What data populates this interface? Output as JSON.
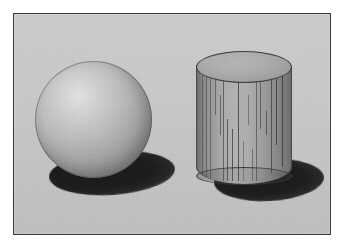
{
  "scene": {
    "title": "Rendered 3D Scene",
    "description": "Computer-generated image of a matte gray sphere and a gray cylinder resting on a light gray ground plane, each casting a dark elliptical shadow to the lower right.",
    "canvas": {
      "width": 344,
      "height": 247
    },
    "frame": {
      "matte_color": "#ffffff",
      "border_color": "#3a3a3a",
      "border_width_px": 1,
      "left": 13,
      "top": 13,
      "width": 318,
      "height": 222
    },
    "background": {
      "name": "ground-plane",
      "color_top": "#cfcfcf",
      "color_bottom": "#c2c2c2",
      "has_grain_noise": true
    },
    "light": {
      "name": "key-light",
      "direction": "upper-left",
      "shadow_direction": "lower-right",
      "shadow_color": "#1b1b1b"
    },
    "objects": [
      {
        "name": "sphere",
        "shape": "sphere",
        "surface": "matte",
        "base_color": "#ababab",
        "highlight_color": "#e6e6e6",
        "terminator_color": "#7e7e7e",
        "center_x": 92,
        "center_y": 119,
        "diameter_px": 117,
        "highlight_x_pct": 37,
        "highlight_y_pct": 30,
        "shadow": {
          "name": "sphere-shadow",
          "shape": "ellipse",
          "color": "#1b1b1b",
          "center_x": 98,
          "center_y": 172,
          "width_px": 126,
          "height_px": 44,
          "rotation_deg": -4
        }
      },
      {
        "name": "cylinder",
        "shape": "cylinder",
        "surface": "matte",
        "base_color": "#b5b5b5",
        "top_face_color": "#b1b1b1",
        "edge_color": "#3d3d3d",
        "left": 195,
        "top": 50,
        "width_px": 96,
        "height_px": 135,
        "top_ellipse_height_px": 32,
        "has_vertical_streak_artifacts": true,
        "streak_count": 18,
        "streak_color": "#303030",
        "shadow": {
          "name": "cylinder-shadow",
          "shape": "ellipse",
          "color": "#1b1b1b",
          "center_x": 268,
          "center_y": 179,
          "width_px": 110,
          "height_px": 42,
          "rotation_deg": -3
        }
      }
    ],
    "streaks": [
      {
        "x": 6,
        "top": 2,
        "height": 112
      },
      {
        "x": 10,
        "top": 2,
        "height": 114
      },
      {
        "x": 14,
        "top": 3,
        "height": 111
      },
      {
        "x": 19,
        "top": 4,
        "height": 44
      },
      {
        "x": 24,
        "top": 28,
        "height": 40
      },
      {
        "x": 27,
        "top": 5,
        "height": 109
      },
      {
        "x": 31,
        "top": 52,
        "height": 62
      },
      {
        "x": 36,
        "top": 62,
        "height": 52
      },
      {
        "x": 42,
        "top": 6,
        "height": 108
      },
      {
        "x": 47,
        "top": 74,
        "height": 40
      },
      {
        "x": 52,
        "top": 28,
        "height": 30
      },
      {
        "x": 56,
        "top": 82,
        "height": 32
      },
      {
        "x": 60,
        "top": 6,
        "height": 108
      },
      {
        "x": 64,
        "top": 10,
        "height": 52
      },
      {
        "x": 70,
        "top": 44,
        "height": 24
      },
      {
        "x": 75,
        "top": 4,
        "height": 102
      },
      {
        "x": 80,
        "top": 8,
        "height": 70
      },
      {
        "x": 86,
        "top": 4,
        "height": 96
      }
    ]
  }
}
